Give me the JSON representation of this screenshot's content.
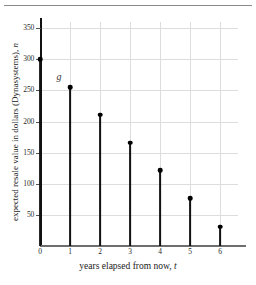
{
  "chart_data": {
    "type": "scatter",
    "title": "",
    "xlabel": "years elapsed from now, t",
    "xlabel_text": "years elapsed from now,",
    "xlabel_var": "t",
    "ylabel": "expected resale value in dollars (Dynasystems), n",
    "ylabel_text": "expected resale value in dollars (Dynasystems),",
    "ylabel_var": "n",
    "x": [
      0,
      1,
      2,
      3,
      4,
      5,
      6
    ],
    "values": [
      300,
      255,
      211,
      166,
      122,
      77,
      31
    ],
    "categories": [
      "0",
      "1",
      "2",
      "3",
      "4",
      "5",
      "6"
    ],
    "xlim": [
      0,
      6.6
    ],
    "ylim": [
      0,
      360
    ],
    "xticks": [
      0,
      1,
      2,
      3,
      4,
      5,
      6
    ],
    "xtick_labels": [
      "0",
      "1",
      "2",
      "3",
      "4",
      "5",
      "6"
    ],
    "yticks": [
      50,
      100,
      150,
      200,
      250,
      300,
      350
    ],
    "ytick_labels": [
      "50",
      "100",
      "150",
      "200",
      "250",
      "300",
      "350"
    ],
    "grid": true,
    "legend": "none",
    "series_label": "g",
    "annotations": [
      {
        "text": "g",
        "x": 0.55,
        "y": 272
      }
    ],
    "marker": "filled-circle",
    "stems": true,
    "colors": {
      "marker": "#000000",
      "stem": "#111111",
      "grid": "#dddddd",
      "axis": "#111111",
      "background": "#ffffff"
    }
  }
}
